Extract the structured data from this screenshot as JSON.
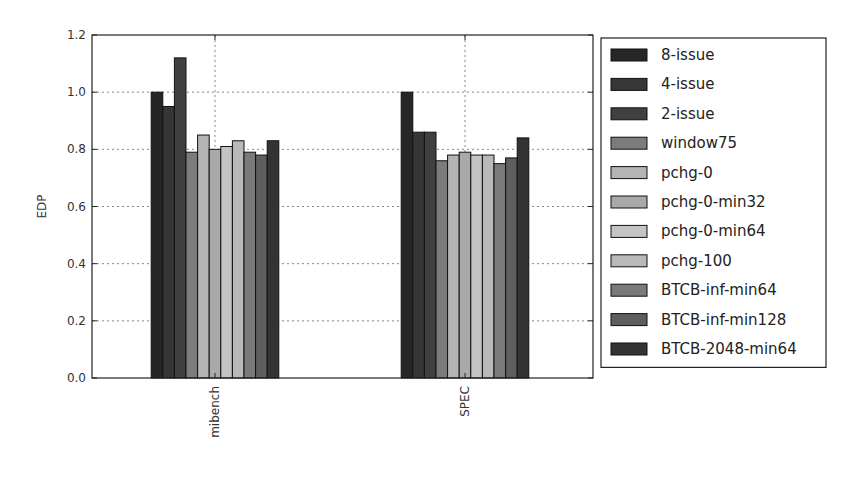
{
  "chart_data": {
    "type": "bar",
    "title": "",
    "xlabel": "",
    "ylabel": "EDP",
    "ylim": [
      0.0,
      1.2
    ],
    "yticks": [
      "0.0",
      "0.2",
      "0.4",
      "0.6",
      "0.8",
      "1.0",
      "1.2"
    ],
    "grid": true,
    "legend_position": "outside-right",
    "categories": [
      "mibench",
      "SPEC"
    ],
    "series": [
      {
        "name": "8-issue",
        "color": "#262626",
        "values": [
          1.0,
          1.0
        ]
      },
      {
        "name": "4-issue",
        "color": "#363636",
        "values": [
          0.95,
          0.86
        ]
      },
      {
        "name": "2-issue",
        "color": "#404040",
        "values": [
          1.12,
          0.86
        ]
      },
      {
        "name": "window75",
        "color": "#7c7c7c",
        "values": [
          0.79,
          0.76
        ]
      },
      {
        "name": "pchg-0",
        "color": "#b4b4b4",
        "values": [
          0.85,
          0.78
        ]
      },
      {
        "name": "pchg-0-min32",
        "color": "#a9a9a9",
        "values": [
          0.8,
          0.79
        ]
      },
      {
        "name": "pchg-0-min64",
        "color": "#c4c4c4",
        "values": [
          0.81,
          0.78
        ]
      },
      {
        "name": "pchg-100",
        "color": "#b9b9b9",
        "values": [
          0.83,
          0.78
        ]
      },
      {
        "name": "BTCB-inf-min64",
        "color": "#7a7a7a",
        "values": [
          0.79,
          0.75
        ]
      },
      {
        "name": "BTCB-inf-min128",
        "color": "#5e5e5e",
        "values": [
          0.78,
          0.77
        ]
      },
      {
        "name": "BTCB-2048-min64",
        "color": "#333333",
        "values": [
          0.83,
          0.84
        ]
      }
    ]
  }
}
